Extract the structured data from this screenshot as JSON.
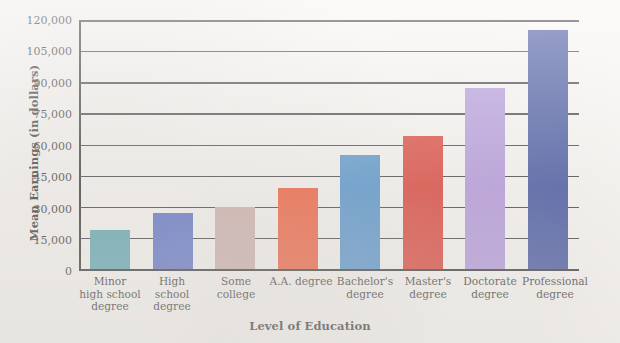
{
  "chart_data": {
    "type": "bar",
    "title": "",
    "xlabel": "Level of Education",
    "ylabel": "Mean Earnings (in dollars)",
    "categories": [
      "Minor high school degree",
      "High school degree",
      "Some college",
      "A.A. degree",
      "Bachelor's degree",
      "Master's degree",
      "Doctorate degree",
      "Professional degree"
    ],
    "values": [
      19000,
      27000,
      30000,
      39000,
      55000,
      64000,
      87000,
      115000
    ],
    "bar_colors": [
      "#4a9ca8",
      "#4a62bf",
      "#c9a8a4",
      "#ef4a23",
      "#3d85c6",
      "#d62b1f",
      "#a98bd8",
      "#2b3f93"
    ],
    "ylim": [
      0,
      120000
    ],
    "ytick_labels": [
      "0",
      "15,000",
      "30,000",
      "45,000",
      "60,000",
      "75,000",
      "90,000",
      "105,000",
      "120,000"
    ],
    "ytick_values": [
      0,
      15000,
      30000,
      45000,
      60000,
      75000,
      90000,
      105000,
      120000
    ],
    "grid": true,
    "legend": "none"
  },
  "axes": {
    "y_title": "Mean Earnings (in dollars)",
    "x_title": "Level of Education"
  },
  "ticks": {
    "t0": "0",
    "t1": "15,000",
    "t2": "30,000",
    "t3": "45,000",
    "t4": "60,000",
    "t5": "75,000",
    "t6": "90,000",
    "t7": "105,000",
    "t8": "120,000"
  },
  "categories": {
    "c0_line1": "Minor",
    "c0_line2": "high school",
    "c0_line3": "degree",
    "c1_line1": "High school",
    "c1_line2": "degree",
    "c2_line1": "Some college",
    "c3_line1": "A.A. degree",
    "c4_line1": "Bachelor's",
    "c4_line2": "degree",
    "c5_line1": "Master's",
    "c5_line2": "degree",
    "c6_line1": "Doctorate",
    "c6_line2": "degree",
    "c7_line1": "Professional",
    "c7_line2": "degree"
  }
}
